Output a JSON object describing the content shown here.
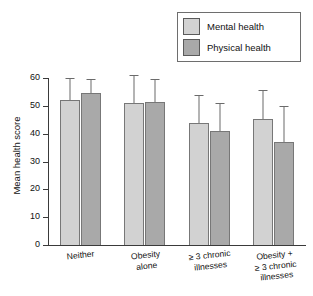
{
  "chart_data": {
    "type": "bar",
    "title": "",
    "xlabel": "",
    "ylabel": "Mean health score",
    "ylim": [
      0,
      60
    ],
    "yticks": [
      0,
      10,
      20,
      30,
      40,
      50,
      60
    ],
    "ytick_labels": [
      "0",
      "10",
      "20",
      "30",
      "40",
      "50",
      "60"
    ],
    "grid": false,
    "legend_position": "top-right",
    "categories": [
      "Neither",
      "Obesity alone",
      "≥ 3 chronic illnesses",
      "Obesity + ≥ 3 chronic illnesses"
    ],
    "category_lines": [
      [
        "Neither"
      ],
      [
        "Obesity",
        "alone"
      ],
      [
        "≥ 3 chronic",
        "illnesses"
      ],
      [
        "Obesity +",
        "≥ 3 chronic",
        "illnesses"
      ]
    ],
    "series": [
      {
        "name": "Mental health",
        "color": "#d2d2d2",
        "values": [
          52.0,
          51.0,
          44.0,
          45.3
        ],
        "error_upper": [
          60.0,
          61.0,
          54.0,
          55.7
        ]
      },
      {
        "name": "Physical health",
        "color": "#a9a9a9",
        "values": [
          54.7,
          51.2,
          41.0,
          37.0
        ],
        "error_upper": [
          59.7,
          59.7,
          51.0,
          50.0
        ]
      }
    ]
  },
  "legend": {
    "items": [
      {
        "label": "Mental health",
        "color": "#d2d2d2"
      },
      {
        "label": "Physical health",
        "color": "#a9a9a9"
      }
    ]
  },
  "axes": {
    "y_title": "Mean health score"
  }
}
